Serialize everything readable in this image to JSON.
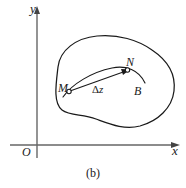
{
  "figure": {
    "caption": "(b)",
    "axes": {
      "x_label": "x",
      "y_label": "y",
      "origin_label": "O"
    },
    "region_label": "B",
    "points": [
      {
        "name": "M",
        "label": "M"
      },
      {
        "name": "N",
        "label": "N"
      }
    ],
    "vector": {
      "delta_symbol": "Δ",
      "variable": "z",
      "label": "Δz",
      "from": "M",
      "to": "N"
    },
    "colors": {
      "stroke": "#1a1a1a",
      "axis": "#555555",
      "background": "#ffffff"
    }
  }
}
